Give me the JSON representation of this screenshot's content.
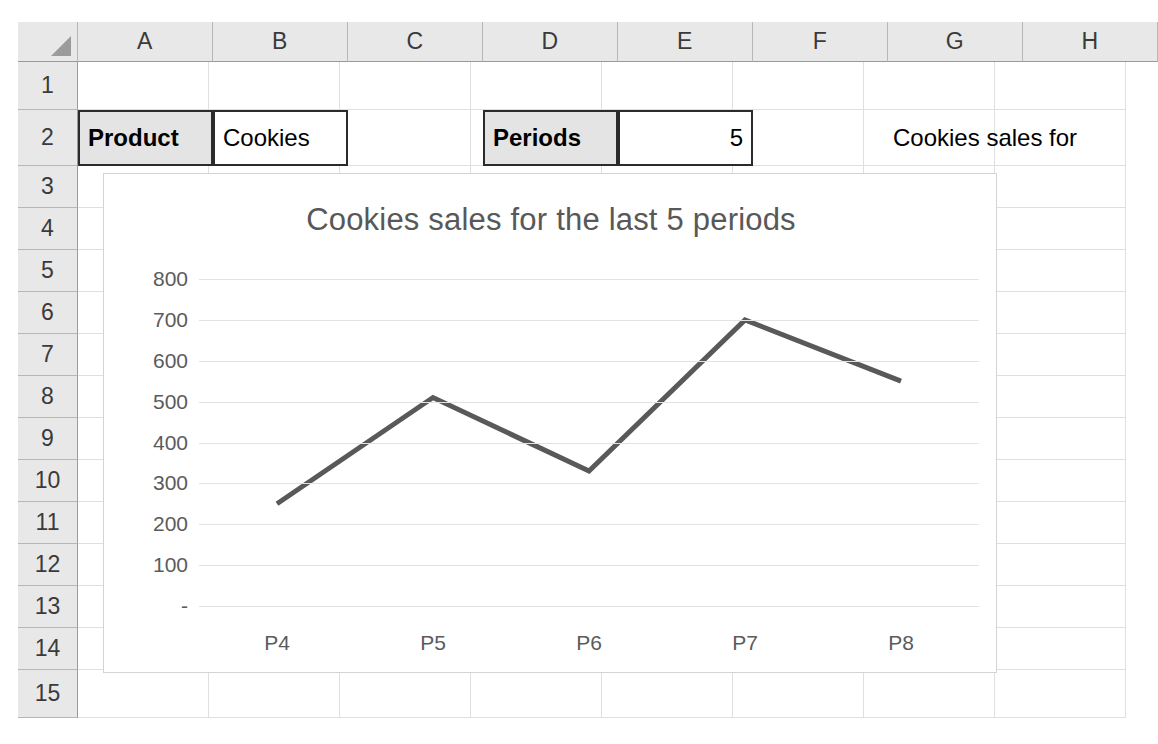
{
  "spreadsheet": {
    "columns": [
      "A",
      "B",
      "C",
      "D",
      "E",
      "F",
      "G",
      "H"
    ],
    "rows": [
      "1",
      "2",
      "3",
      "4",
      "5",
      "6",
      "7",
      "8",
      "9",
      "10",
      "11",
      "12",
      "13",
      "14",
      "15"
    ],
    "select_all_icon": "select-all-triangle-icon",
    "cells": {
      "a2_label": "Product",
      "b2_value": "Cookies",
      "d2_label": "Periods",
      "e2_value": "5",
      "g2_text": "Cookies sales for"
    }
  },
  "chart_data": {
    "type": "line",
    "title": "Cookies sales for the last 5 periods",
    "xlabel": "",
    "ylabel": "",
    "categories": [
      "P4",
      "P5",
      "P6",
      "P7",
      "P8"
    ],
    "values": [
      250,
      510,
      330,
      700,
      550
    ],
    "series": [
      {
        "name": "Cookies sales",
        "values": [
          250,
          510,
          330,
          700,
          550
        ]
      }
    ],
    "yticks": [
      "800",
      "700",
      "600",
      "500",
      "400",
      "300",
      "200",
      "100",
      "-"
    ],
    "ytick_values": [
      800,
      700,
      600,
      500,
      400,
      300,
      200,
      100,
      0
    ],
    "ylim": [
      0,
      800
    ],
    "grid": true,
    "legend": false,
    "line_color": "#595959",
    "title_color": "#585858",
    "gridline_color": "#e2e2e2"
  }
}
